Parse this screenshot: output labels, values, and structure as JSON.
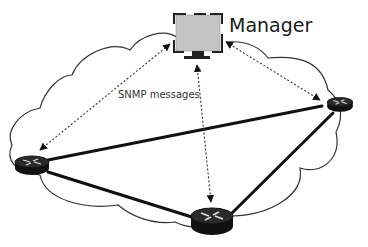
{
  "diagram": {
    "manager_label": "Manager",
    "messages_label": "SNMP messages",
    "nodes": [
      {
        "id": "manager",
        "type": "workstation",
        "label": "Manager"
      },
      {
        "id": "router-left",
        "type": "router"
      },
      {
        "id": "router-right",
        "type": "router"
      },
      {
        "id": "router-bottom",
        "type": "router"
      }
    ],
    "links": [
      {
        "from": "router-left",
        "to": "router-right",
        "style": "solid"
      },
      {
        "from": "router-left",
        "to": "router-bottom",
        "style": "solid"
      },
      {
        "from": "router-bottom",
        "to": "router-right",
        "style": "solid"
      },
      {
        "from": "manager",
        "to": "router-left",
        "style": "dotted-bidirectional"
      },
      {
        "from": "manager",
        "to": "router-right",
        "style": "dotted-bidirectional"
      },
      {
        "from": "manager",
        "to": "router-bottom",
        "style": "dotted-bidirectional"
      }
    ],
    "colors": {
      "line": "#111111",
      "monitor_fill": "#c4c4c4",
      "cloud_stroke": "#333333"
    }
  }
}
